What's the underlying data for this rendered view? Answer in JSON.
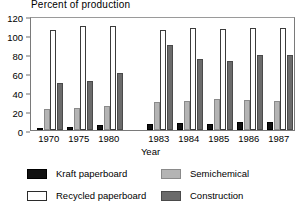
{
  "chart_data": {
    "type": "bar",
    "title": "Percent of production",
    "xlabel": "Year",
    "ylabel": "",
    "ylim": [
      0,
      120
    ],
    "yticks": [
      0,
      20,
      40,
      60,
      80,
      100,
      120
    ],
    "grid": false,
    "legend_position": "bottom",
    "categories": [
      "1970",
      "1975",
      "1980",
      "1983",
      "1984",
      "1985",
      "1986",
      "1987"
    ],
    "category_gap_after": "1980",
    "series": [
      {
        "name": "Kraft paperboard",
        "color": "#111111",
        "values": [
          2,
          3,
          5,
          6,
          7,
          6,
          8,
          8
        ]
      },
      {
        "name": "Semichemical",
        "color": "#b4b4b4",
        "values": [
          22,
          23,
          25,
          29,
          31,
          33,
          32,
          31
        ]
      },
      {
        "name": "Recycled paperboard",
        "color": "#ffffff",
        "values": [
          105,
          110,
          110,
          105,
          107,
          106,
          107,
          107
        ]
      },
      {
        "name": "Construction",
        "color": "#6b6b6b",
        "values": [
          50,
          52,
          60,
          89,
          75,
          73,
          79,
          79
        ]
      }
    ]
  },
  "legend": {
    "items": [
      {
        "label": "Kraft paperboard",
        "swatch": "kraft"
      },
      {
        "label": "Semichemical",
        "swatch": "semi"
      },
      {
        "label": "Recycled paperboard",
        "swatch": "recycled"
      },
      {
        "label": "Construction",
        "swatch": "constr"
      }
    ]
  }
}
